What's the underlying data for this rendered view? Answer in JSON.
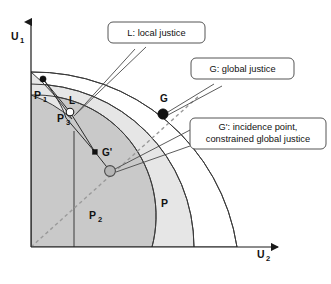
{
  "figure": {
    "name": "utility-possibility-frontier-diagram",
    "background": "#ffffff"
  },
  "axes": {
    "y_label": "U",
    "y_sub": "1",
    "x_label": "U",
    "x_sub": "2",
    "color": "#1a1a1a"
  },
  "regions": [
    {
      "key": "p1",
      "label": "P",
      "sub": "1",
      "fill": "#e6e6e6"
    },
    {
      "key": "p2",
      "label": "P",
      "sub": "2",
      "fill": "#e6e6e6"
    },
    {
      "key": "p",
      "label": "P",
      "sub": "",
      "fill": "#ffffff"
    },
    {
      "key": "p3",
      "label": "P",
      "sub": "3",
      "fill": "#c9c9c9"
    }
  ],
  "points": [
    {
      "key": "p1_dot",
      "label": "",
      "style": "solid-black"
    },
    {
      "key": "L",
      "label": "L",
      "style": "hollow-white"
    },
    {
      "key": "G",
      "label": "G",
      "style": "solid-black"
    },
    {
      "key": "Gprime_small",
      "label": "",
      "style": "solid-black-small"
    },
    {
      "key": "Gprime",
      "label": "G'",
      "style": "gray-filled"
    }
  ],
  "point_labels": {
    "L": "L",
    "G": "G",
    "G_prime": "G'",
    "P3": "P"
  },
  "callouts": [
    {
      "key": "local-justice",
      "lines": [
        "L: local justice"
      ]
    },
    {
      "key": "global-justice",
      "lines": [
        "G: global justice"
      ]
    },
    {
      "key": "incidence-point",
      "lines": [
        "G': incidence point,",
        "constrained global justice"
      ]
    }
  ],
  "colors": {
    "shade_dark": "#c9c9c9",
    "shade_light": "#e6e6e6",
    "stroke": "#3a3a3a",
    "dashed": "#9a9a9a",
    "text": "#111111"
  }
}
